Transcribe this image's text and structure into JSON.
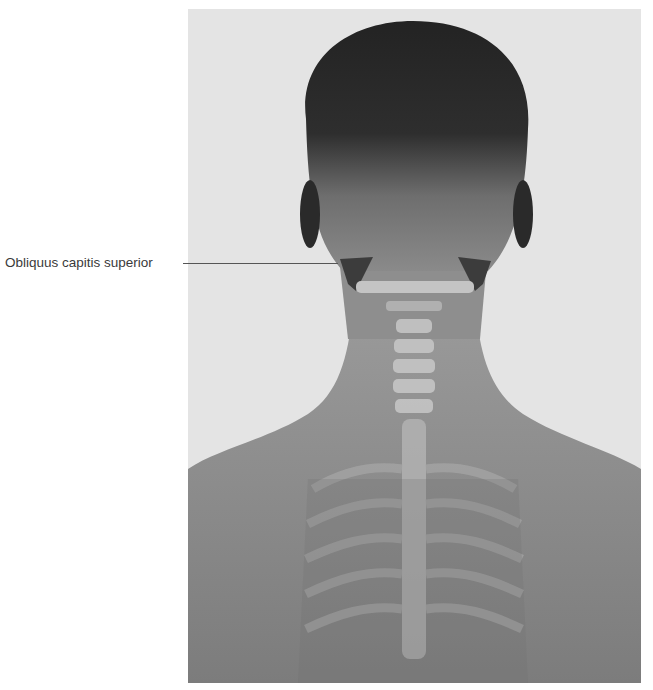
{
  "figure": {
    "colors": {
      "background": "#e4e4e4",
      "skin": "#8c8c8c",
      "hair": "#2a2a2a",
      "muscle": "#3c3c3c",
      "bone": "#c8c8c8"
    }
  },
  "labels": [
    {
      "text": "Obliquus capitis superior",
      "target": "suboccipital muscle, left side"
    }
  ]
}
